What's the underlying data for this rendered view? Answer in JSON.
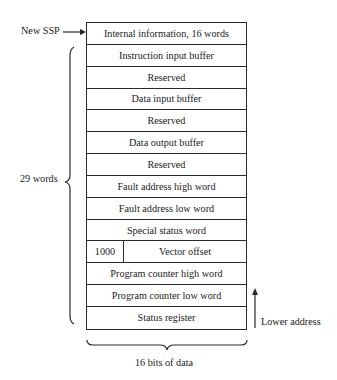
{
  "diagram": {
    "pointer_label": "New SSP",
    "rows": [
      {
        "label": "Internal information, 16 words"
      },
      {
        "label": "Instruction input buffer"
      },
      {
        "label": "Reserved"
      },
      {
        "label": "Data input buffer"
      },
      {
        "label": "Reserved"
      },
      {
        "label": "Data output buffer"
      },
      {
        "label": "Reserved"
      },
      {
        "label": "Fault address high word"
      },
      {
        "label": "Fault address low word"
      },
      {
        "label": "Special status word"
      },
      {
        "left": "1000",
        "label": "Vector offset"
      },
      {
        "label": "Program counter high word"
      },
      {
        "label": "Program counter low word"
      },
      {
        "label": "Status register"
      }
    ],
    "left_brace_label": "29 words",
    "direction_label": "Lower address",
    "bottom_brace_label": "16 bits of data",
    "colors": {
      "line": "#2a2a2a",
      "text": "#1c1c1c",
      "background": "#ffffff"
    }
  }
}
